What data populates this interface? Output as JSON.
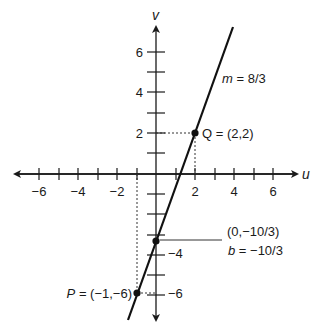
{
  "diagram": {
    "type": "coordinate-plane-line",
    "axes": {
      "x_name": "u",
      "y_name": "v",
      "x_tick_labels": [
        {
          "value": -6,
          "label": "−6"
        },
        {
          "value": -4,
          "label": "−4"
        },
        {
          "value": -2,
          "label": "−2"
        },
        {
          "value": 2,
          "label": "2"
        },
        {
          "value": 4,
          "label": "4"
        },
        {
          "value": 6,
          "label": "6"
        }
      ],
      "y_tick_labels": [
        {
          "value": 6,
          "label": "6"
        },
        {
          "value": 4,
          "label": "4"
        },
        {
          "value": 2,
          "label": "2"
        },
        {
          "value": -4,
          "label": "−4"
        },
        {
          "value": -6,
          "label": "−6"
        }
      ],
      "x_range": [
        -7,
        7
      ],
      "y_range": [
        -7,
        7
      ]
    },
    "line": {
      "slope_label_var": "m",
      "slope_label_value": " = 8/3",
      "slope": 2.6667,
      "intercept": -3.3333
    },
    "points": {
      "Q": {
        "name": "Q",
        "text": " = (2,2)",
        "u": 2,
        "v": 2
      },
      "P": {
        "name": "P",
        "text": " = (−1,−6)",
        "u": -1,
        "v": -6
      },
      "intercept": {
        "coord_text": "(0,−10/3)",
        "b_var": "b",
        "b_text": " = −10/3",
        "u": 0,
        "v": -3.3333
      }
    },
    "colors": {
      "ink": "#1a1a1a",
      "background": "#ffffff"
    }
  }
}
